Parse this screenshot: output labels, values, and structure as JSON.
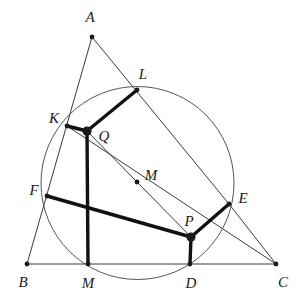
{
  "figure": {
    "type": "geometry-diagram",
    "canvas": {
      "width": 304,
      "height": 301,
      "background": "#ffffff"
    },
    "styles": {
      "thin_stroke": "#3b3b3b",
      "thin_width": 1,
      "bold_stroke": "#111111",
      "bold_width": 3.4,
      "circle_stroke": "#555555",
      "circle_width": 1,
      "dot_fill": "#1a1a1a"
    },
    "circle": {
      "name": "circumscribed-circle",
      "cx": 137.5,
      "cy": 183,
      "r": 96.5
    },
    "points": [
      {
        "id": "A",
        "label": "A",
        "x": 92,
        "y": 37,
        "lx": 90,
        "ly": 17,
        "dot": "small"
      },
      {
        "id": "B",
        "label": "B",
        "x": 27,
        "y": 264,
        "lx": 23,
        "ly": 282,
        "dot": "small"
      },
      {
        "id": "C",
        "label": "C",
        "x": 276,
        "y": 264,
        "lx": 283,
        "ly": 282,
        "dot": "small"
      },
      {
        "id": "K",
        "label": "K",
        "x": 67,
        "y": 126,
        "lx": 54,
        "ly": 118,
        "dot": "small"
      },
      {
        "id": "L",
        "label": "L",
        "x": 137,
        "y": 90,
        "lx": 143,
        "ly": 74,
        "dot": "small"
      },
      {
        "id": "F",
        "label": "F",
        "x": 47,
        "y": 196,
        "lx": 34,
        "ly": 190,
        "dot": "small"
      },
      {
        "id": "E",
        "label": "E",
        "x": 229,
        "y": 204,
        "lx": 243,
        "ly": 198,
        "dot": "small"
      },
      {
        "id": "Mb",
        "label": "M",
        "x": 88,
        "y": 264,
        "lx": 88,
        "ly": 283,
        "dot": "small"
      },
      {
        "id": "D",
        "label": "D",
        "x": 190,
        "y": 264,
        "lx": 191,
        "ly": 283,
        "dot": "small"
      },
      {
        "id": "Q",
        "label": "Q",
        "x": 87,
        "y": 131,
        "lx": 104,
        "ly": 136,
        "dot": "big"
      },
      {
        "id": "P",
        "label": "P",
        "x": 191,
        "y": 237,
        "lx": 189,
        "ly": 221,
        "dot": "big"
      },
      {
        "id": "Mc",
        "label": "M",
        "x": 137,
        "y": 182,
        "lx": 151,
        "ly": 175,
        "dot": "small"
      }
    ],
    "thin_segments": [
      {
        "name": "segment-A-B",
        "x1": 92,
        "y1": 37,
        "x2": 27,
        "y2": 264
      },
      {
        "name": "segment-A-E",
        "x1": 92,
        "y1": 37,
        "x2": 229,
        "y2": 204
      },
      {
        "name": "segment-E-C",
        "x1": 229,
        "y1": 204,
        "x2": 276,
        "y2": 264
      },
      {
        "name": "segment-B-C",
        "x1": 27,
        "y1": 264,
        "x2": 276,
        "y2": 264
      },
      {
        "name": "segment-K-C",
        "x1": 67,
        "y1": 126,
        "x2": 276,
        "y2": 264
      },
      {
        "name": "segment-Q-P",
        "x1": 87,
        "y1": 131,
        "x2": 191,
        "y2": 237
      }
    ],
    "bold_segments": [
      {
        "name": "segment-K-Q",
        "x1": 67,
        "y1": 126,
        "x2": 87,
        "y2": 131
      },
      {
        "name": "segment-Q-L",
        "x1": 87,
        "y1": 131,
        "x2": 137,
        "y2": 90
      },
      {
        "name": "segment-Q-M",
        "x1": 87,
        "y1": 131,
        "x2": 88,
        "y2": 264
      },
      {
        "name": "segment-F-P",
        "x1": 47,
        "y1": 196,
        "x2": 191,
        "y2": 237
      },
      {
        "name": "segment-P-D",
        "x1": 191,
        "y1": 237,
        "x2": 190,
        "y2": 264
      },
      {
        "name": "segment-P-E",
        "x1": 191,
        "y1": 237,
        "x2": 229,
        "y2": 204
      }
    ]
  }
}
